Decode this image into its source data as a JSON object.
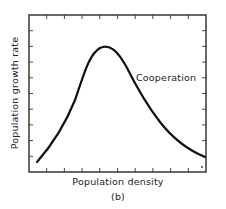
{
  "chart_data": {
    "type": "line",
    "title": "",
    "panel_label": "(b)",
    "xlabel": "Population density",
    "ylabel": "Population growth rate",
    "grid": false,
    "legend": null,
    "annotations": [
      {
        "text": "Cooperation",
        "near": "descending limb of curve"
      }
    ],
    "axes_ticks": {
      "x_count": 9,
      "y_count": 9,
      "tick_labels": "none"
    },
    "xlim": [
      0,
      1
    ],
    "ylim": [
      0,
      1
    ],
    "series": [
      {
        "name": "Cooperation",
        "x": [
          0.05,
          0.15,
          0.25,
          0.35,
          0.42,
          0.48,
          0.55,
          0.65,
          0.75,
          0.85,
          0.95
        ],
        "y": [
          0.06,
          0.22,
          0.42,
          0.66,
          0.82,
          0.79,
          0.66,
          0.45,
          0.29,
          0.17,
          0.09
        ]
      }
    ]
  },
  "figure": {
    "xlabel": "Population density",
    "ylabel": "Population growth rate",
    "panel_label": "(b)",
    "annotation": "Cooperation"
  }
}
